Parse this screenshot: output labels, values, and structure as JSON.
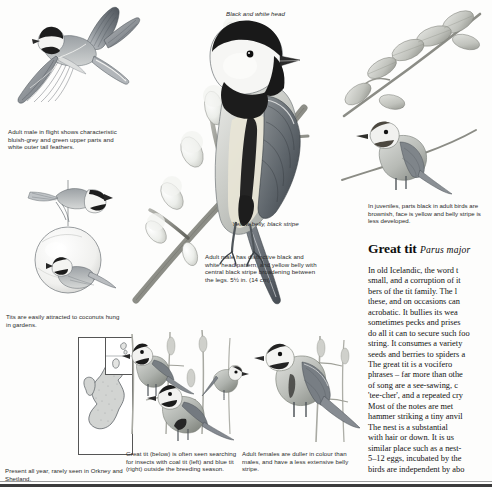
{
  "page": {
    "background_color": "#fdfdfc",
    "ink_color": "#2b2b2b"
  },
  "labels": {
    "head_label": "Black and\nwhite head",
    "belly_label": "Yellow belly,\nblack stripe"
  },
  "captions": {
    "flight": "Adult male in flight shows characteristic bluish-grey and green upper parts and white outer tail feathers.",
    "coconut": "Tits are easily attracted to coconuts hung in gardens.",
    "map": "Present all year, rarely seen in Orkney and Shetland.",
    "main_bird": "Adult male has distinctive black and white head pattern, and yellow belly with central black stripe broadening between the legs. 5½ in. (14 cm).",
    "mixed_flock": "Great tit (below) is often seen searching for insects with coal tit (left) and blue tit (right) outside the breeding season.",
    "female": "Adult females are duller in colour than males, and have a less extensive belly stripe.",
    "juvenile": "In juveniles, parts black in adult birds are brownish, face is yellow and belly stripe is less developed."
  },
  "article": {
    "title": "Great tit",
    "scientific_name": "Parus major",
    "body": "In old Icelandic, the word t\nsmall, and a corruption of it\nbers of the tit family. The l\nthese, and on occasions can\nacrobatic. It bullies its wea\nsometimes pecks and prises\ndo all it can to secure such foo\nstring. It consumes a variety\nseeds and berries to spiders a\n    The great tit is a vocifero\nphrases – far more than othe\nof song are a see-sawing, c\n'tee-cher', and a repeated cry\nMost of the notes are met\nhammer striking a tiny anvil\n    The nest is a substantial\nwith hair or down. It is us\nsimilar place such as a nest-\n5–12 eggs, incubated by the\nbirds are independent by abo"
  },
  "illustrations": {
    "flying_bird": "great-tit-in-flight",
    "coconut_feeder": "great-tit-on-hanging-coconut",
    "main_bird": "adult-male-great-tit-on-willow-branch",
    "juvenile_bird": "juvenile-great-tit",
    "female_bird": "adult-female-great-tit",
    "mixed_flock": "coal-tit-great-tit-and-blue-tit",
    "distribution_map": "uk-distribution-map"
  }
}
